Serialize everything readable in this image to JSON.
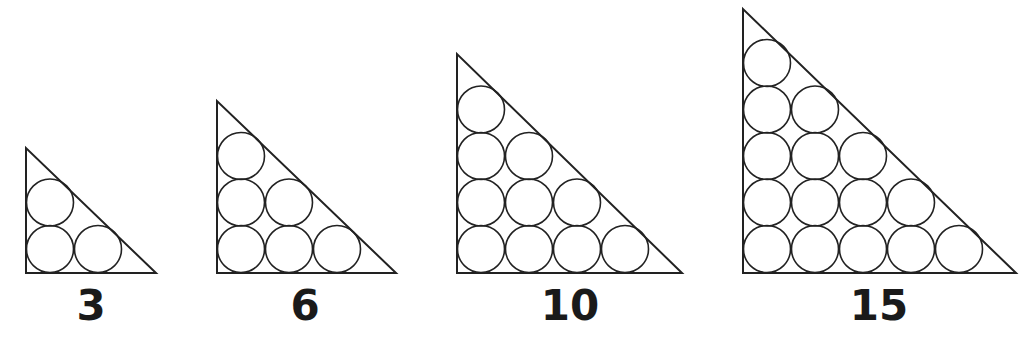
{
  "figure": {
    "stroke_color": "#222222",
    "background": "#ffffff",
    "circle_radius": 23.5,
    "col_pitch": 48,
    "row_pitch": 46.5,
    "baseline_y": 273,
    "triangles": [
      {
        "label": "3",
        "rows": 2,
        "left_x": 26,
        "apex_y": 148,
        "right_x": 156,
        "label_x": 91
      },
      {
        "label": "6",
        "rows": 3,
        "left_x": 217,
        "apex_y": 101,
        "right_x": 396,
        "label_x": 305
      },
      {
        "label": "10",
        "rows": 4,
        "left_x": 457,
        "apex_y": 54,
        "right_x": 682,
        "label_x": 570
      },
      {
        "label": "15",
        "rows": 5,
        "left_x": 743,
        "apex_y": 9,
        "right_x": 1016,
        "label_x": 879
      }
    ]
  }
}
